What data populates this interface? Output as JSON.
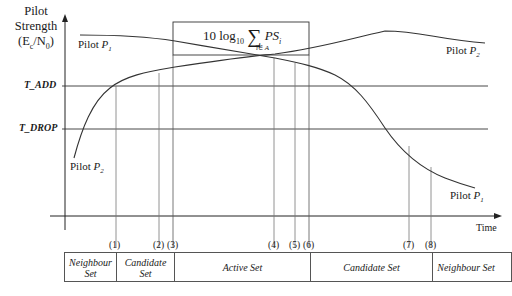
{
  "axes": {
    "y_label_lines": [
      "Pilot",
      "Strength",
      "(E",
      "c",
      "/N",
      "0",
      ")"
    ],
    "x_label": "Time"
  },
  "thresholds": {
    "t_add": "T_ADD",
    "t_drop": "T_DROP"
  },
  "formula": {
    "prefix": "10 log",
    "sub": "10",
    "sum": "∑",
    "under": "i∈ A",
    "term": "PS",
    "term_sub": "i"
  },
  "curves": {
    "p1_left": {
      "text": "Pilot ",
      "sym": "P",
      "sub": "1"
    },
    "p2_left": {
      "text": "Pilot ",
      "sym": "P",
      "sub": "2"
    },
    "p2_right": {
      "text": "Pilot ",
      "sym": "P",
      "sub": "2"
    },
    "p1_right": {
      "text": "Pilot ",
      "sym": "P",
      "sub": "1"
    }
  },
  "markers": [
    "(1)",
    "(2)",
    "(3)",
    "(4)",
    "(5)",
    "(6)",
    "(7)",
    "(8)"
  ],
  "sets": [
    {
      "label_line1": "Neighbour",
      "label_line2": "Set"
    },
    {
      "label_line1": "Candidate",
      "label_line2": "Set"
    },
    {
      "label_line1": "Active Set",
      "label_line2": ""
    },
    {
      "label_line1": "Candidate Set",
      "label_line2": ""
    },
    {
      "label_line1": "Neighbour Set",
      "label_line2": ""
    }
  ]
}
